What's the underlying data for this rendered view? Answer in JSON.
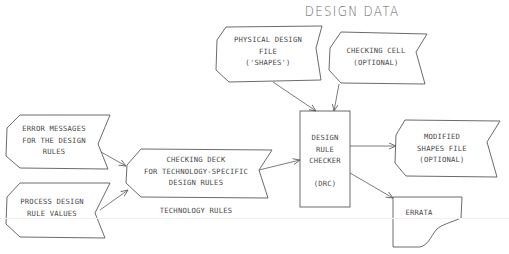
{
  "diagram": {
    "title": "DESIGN DATA",
    "section_label": "TECHNOLOGY RULES",
    "nodes": {
      "physical_design_file": {
        "lines": [
          "PHYSICAL DESIGN",
          "FILE",
          "('SHAPES')"
        ],
        "shape": "punched-tape"
      },
      "checking_cell": {
        "lines": [
          "CHECKING CELL",
          "(OPTIONAL)"
        ],
        "shape": "punched-tape"
      },
      "error_messages": {
        "lines": [
          "ERROR MESSAGES",
          "FOR THE DESIGN",
          "RULES"
        ],
        "shape": "punched-tape"
      },
      "process_design_rule_values": {
        "lines": [
          "PROCESS DESIGN",
          "RULE VALUES"
        ],
        "shape": "punched-tape"
      },
      "checking_deck": {
        "lines": [
          "CHECKING DECK",
          "FOR TECHNOLOGY-SPECIFIC",
          "DESIGN RULES"
        ],
        "shape": "punched-tape"
      },
      "design_rule_checker": {
        "lines": [
          "DESIGN",
          "RULE",
          "CHECKER",
          "",
          "(DRC)"
        ],
        "shape": "rectangle"
      },
      "modified_shapes_file": {
        "lines": [
          "MODIFIED",
          "SHAPES FILE",
          "(OPTIONAL)"
        ],
        "shape": "punched-tape"
      },
      "errata": {
        "lines": [
          "ERRATA"
        ],
        "shape": "document"
      }
    },
    "edges": [
      {
        "from": "physical_design_file",
        "to": "design_rule_checker"
      },
      {
        "from": "checking_cell",
        "to": "design_rule_checker"
      },
      {
        "from": "error_messages",
        "to": "checking_deck"
      },
      {
        "from": "process_design_rule_values",
        "to": "checking_deck"
      },
      {
        "from": "checking_deck",
        "to": "design_rule_checker"
      },
      {
        "from": "design_rule_checker",
        "to": "modified_shapes_file"
      },
      {
        "from": "design_rule_checker",
        "to": "errata"
      }
    ],
    "colors": {
      "stroke": "#5a5a5a",
      "text": "#4a4a4a",
      "background": "#ffffff"
    }
  },
  "text": {
    "title": "DESIGN DATA",
    "physical": "PHYSICAL DESIGN\nFILE\n('SHAPES')",
    "checking_cell": "CHECKING CELL\n(OPTIONAL)",
    "error_messages": "ERROR MESSAGES\nFOR THE DESIGN\nRULES",
    "process": "PROCESS DESIGN\nRULE VALUES",
    "checking_deck": "CHECKING DECK\nFOR TECHNOLOGY-SPECIFIC\nDESIGN RULES",
    "tech_rules": "TECHNOLOGY RULES",
    "drc": "DESIGN\nRULE\nCHECKER\n\n(DRC)",
    "modified": "MODIFIED\nSHAPES FILE\n(OPTIONAL)",
    "errata": "ERRATA"
  }
}
